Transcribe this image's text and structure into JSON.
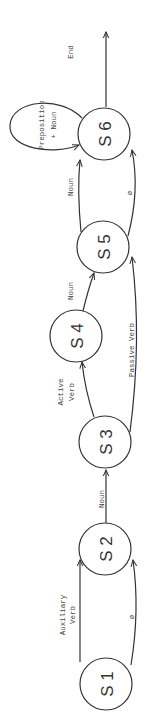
{
  "diagram": {
    "orientation": "rotated-90-ccw",
    "states": [
      {
        "id": "s1",
        "label": "S 1"
      },
      {
        "id": "s2",
        "label": "S 2"
      },
      {
        "id": "s3",
        "label": "S 3"
      },
      {
        "id": "s4",
        "label": "S 4"
      },
      {
        "id": "s5",
        "label": "S 5"
      },
      {
        "id": "s6",
        "label": "S 6"
      }
    ],
    "transitions": [
      {
        "from": "s1",
        "to": "s2",
        "label_line1": "Auxiliary",
        "label_line2": "Verb"
      },
      {
        "from": "s1",
        "to": "s2",
        "label_line1": "ø"
      },
      {
        "from": "s2",
        "to": "s3",
        "label_line1": "Noun"
      },
      {
        "from": "s3",
        "to": "s4",
        "label_line1": "Active",
        "label_line2": "Verb"
      },
      {
        "from": "s3",
        "to": "s5",
        "label_line1": "Passive Verb"
      },
      {
        "from": "s4",
        "to": "s5",
        "label_line1": "Noun"
      },
      {
        "from": "s5",
        "to": "s6",
        "label_line1": "Noun"
      },
      {
        "from": "s5",
        "to": "s6",
        "label_line1": "ø"
      },
      {
        "from": "s6",
        "to": "s6",
        "label_line1": "Preposition",
        "label_line2": "+ Noun"
      },
      {
        "from": "s6",
        "to": "end",
        "label_line1": "End"
      }
    ]
  },
  "colors": {
    "stroke": "#333333",
    "background": "#ffffff"
  }
}
